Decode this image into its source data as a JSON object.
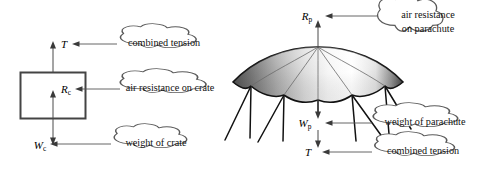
{
  "figure": {
    "background_color": "#ffffff",
    "line_color": "#555555",
    "canopy_dark": "#4a4a4a",
    "canopy_light": "#ffffff"
  },
  "crate_diagram": {
    "name": "crate free-body diagram",
    "shape_label": "crate",
    "forces": [
      {
        "id": "tension",
        "symbol": "T",
        "subscript": "",
        "direction": "up",
        "callout": "combined tension"
      },
      {
        "id": "air-resistance",
        "symbol": "R",
        "subscript": "c",
        "direction": "up",
        "callout": "air resistance on crate"
      },
      {
        "id": "weight",
        "symbol": "W",
        "subscript": "c",
        "direction": "down",
        "callout": "weight of crate"
      }
    ]
  },
  "parachute_diagram": {
    "name": "parachute free-body diagram",
    "shape_label": "parachute canopy",
    "gore_count": 5,
    "forces": [
      {
        "id": "air-resistance",
        "symbol": "R",
        "subscript": "p",
        "direction": "up",
        "callout_line1": "air resistance",
        "callout_line2": "on parachute"
      },
      {
        "id": "weight",
        "symbol": "W",
        "subscript": "p",
        "direction": "down",
        "callout_line1": "weight of parachute",
        "callout_line2": ""
      },
      {
        "id": "tension",
        "symbol": "T",
        "subscript": "",
        "direction": "down",
        "callout_line1": "combined tension",
        "callout_line2": ""
      }
    ]
  }
}
